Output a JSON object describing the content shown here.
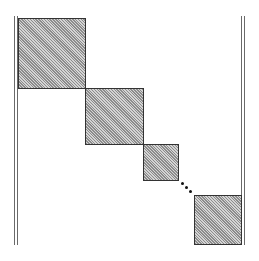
{
  "diagram": {
    "type": "block-diagonal-matrix",
    "colors": {
      "background": "#ffffff",
      "block_fill": "#b8b8b8",
      "block_border": "#333333",
      "delimiter": "#6a6a6a",
      "ellipsis": "#111111"
    },
    "delimiters": {
      "left": {
        "lines_x": [
          14,
          18
        ],
        "top": 16,
        "bottom": 245
      },
      "right": {
        "lines_x": [
          240,
          244
        ],
        "top": 16,
        "bottom": 245
      }
    },
    "blocks": [
      {
        "id": "block-1",
        "x": 18,
        "y": 18,
        "w": 67,
        "h": 70
      },
      {
        "id": "block-2",
        "x": 85,
        "y": 88,
        "w": 58,
        "h": 56
      },
      {
        "id": "block-3",
        "x": 143,
        "y": 144,
        "w": 35,
        "h": 36
      },
      {
        "id": "block-4",
        "x": 194,
        "y": 195,
        "w": 48,
        "h": 50
      }
    ],
    "ellipsis": {
      "symbol": "⋱",
      "dots": [
        {
          "x": 182,
          "y": 183
        },
        {
          "x": 186,
          "y": 187
        },
        {
          "x": 189,
          "y": 191
        }
      ]
    }
  }
}
